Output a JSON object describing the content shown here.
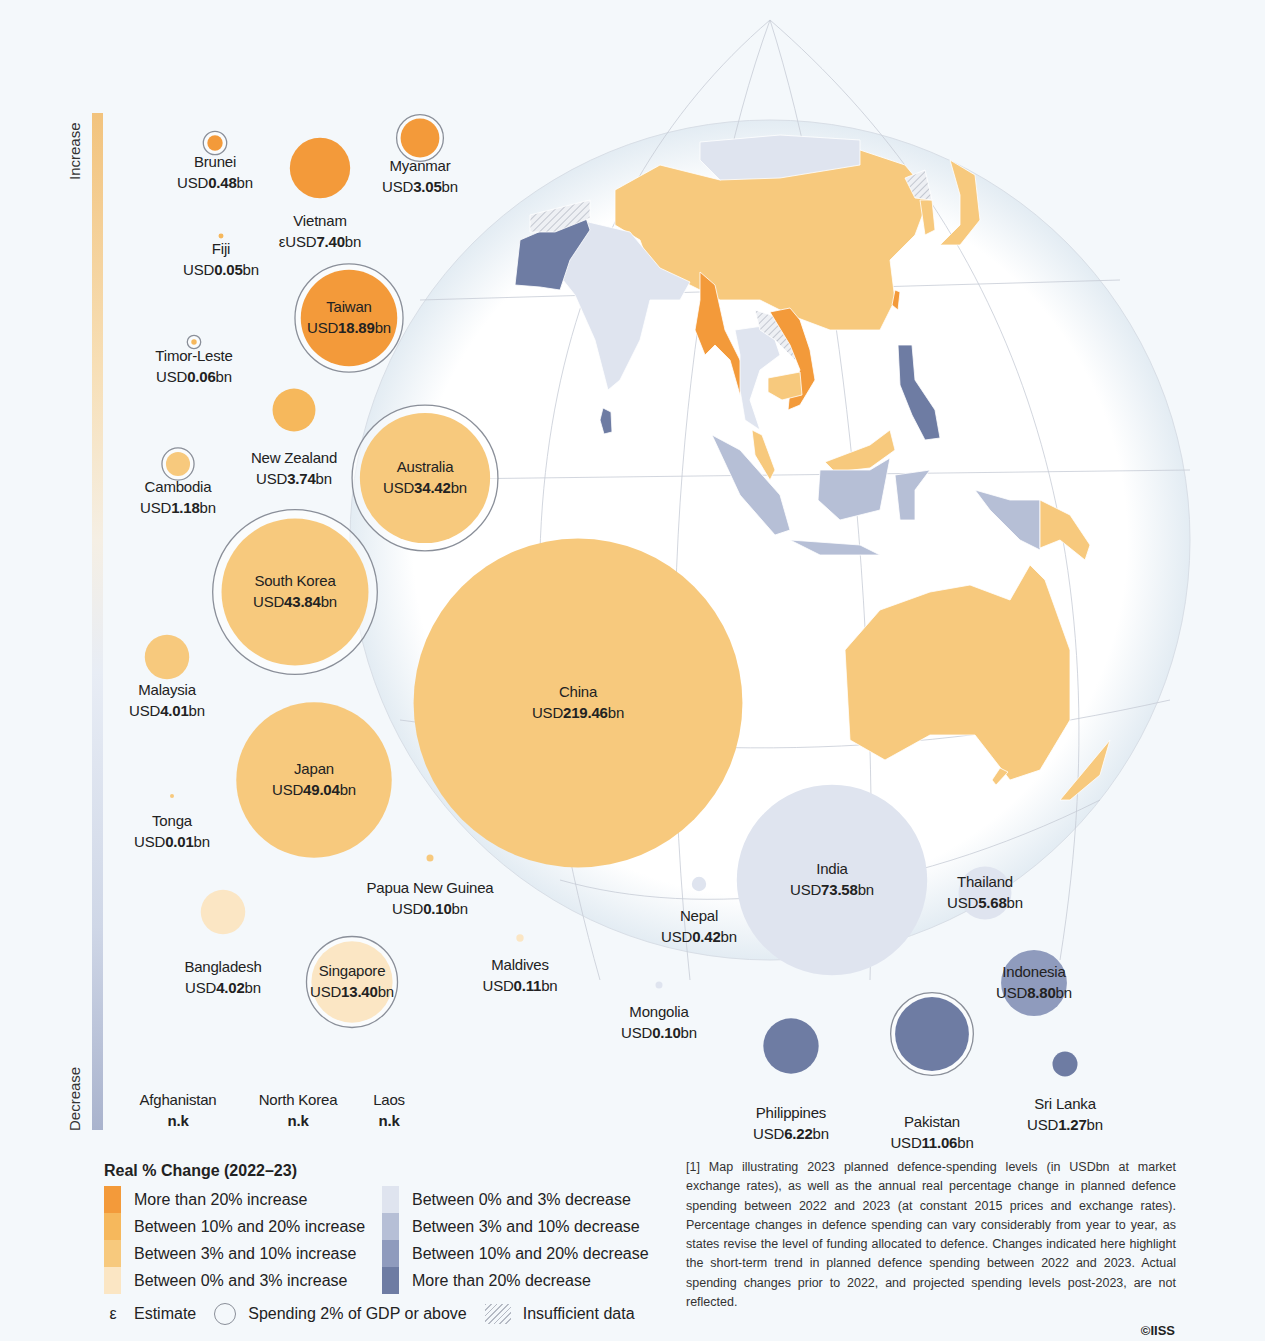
{
  "axis": {
    "top_label": "Increase",
    "bottom_label": "Decrease"
  },
  "colors": {
    "inc_gt20": "#f39a3a",
    "inc_10_20": "#f6b85c",
    "inc_3_10": "#f7c97d",
    "inc_0_3": "#fbe6c4",
    "dec_0_3": "#dfe4ef",
    "dec_3_10": "#b6bfd6",
    "dec_10_20": "#8f9bbd",
    "dec_gt20": "#6e7ca3",
    "ring": "#8a8f99",
    "background": "#f4f8fb"
  },
  "chart_data": {
    "type": "bubble-map",
    "title": "Real % Change (2022–23)",
    "unit": "USDbn",
    "countries": [
      {
        "name": "Brunei",
        "prefix": "USD",
        "value": "0.48",
        "suffix": "bn",
        "category": "inc_gt20",
        "gdp2pct": true
      },
      {
        "name": "Vietnam",
        "prefix": "εUSD",
        "value": "7.40",
        "suffix": "bn",
        "category": "inc_gt20",
        "gdp2pct": false,
        "estimate": true
      },
      {
        "name": "Myanmar",
        "prefix": "USD",
        "value": "3.05",
        "suffix": "bn",
        "category": "inc_gt20",
        "gdp2pct": true
      },
      {
        "name": "Fiji",
        "prefix": "USD",
        "value": "0.05",
        "suffix": "bn",
        "category": "inc_10_20",
        "gdp2pct": false
      },
      {
        "name": "Taiwan",
        "prefix": "USD",
        "value": "18.89",
        "suffix": "bn",
        "category": "inc_gt20",
        "gdp2pct": true
      },
      {
        "name": "Timor-Leste",
        "prefix": "USD",
        "value": "0.06",
        "suffix": "bn",
        "category": "inc_10_20",
        "gdp2pct": true
      },
      {
        "name": "New Zealand",
        "prefix": "USD",
        "value": "3.74",
        "suffix": "bn",
        "category": "inc_10_20",
        "gdp2pct": false
      },
      {
        "name": "Cambodia",
        "prefix": "USD",
        "value": "1.18",
        "suffix": "bn",
        "category": "inc_3_10",
        "gdp2pct": true
      },
      {
        "name": "Australia",
        "prefix": "USD",
        "value": "34.42",
        "suffix": "bn",
        "category": "inc_3_10",
        "gdp2pct": true
      },
      {
        "name": "South Korea",
        "prefix": "USD",
        "value": "43.84",
        "suffix": "bn",
        "category": "inc_3_10",
        "gdp2pct": true
      },
      {
        "name": "Malaysia",
        "prefix": "USD",
        "value": "4.01",
        "suffix": "bn",
        "category": "inc_3_10",
        "gdp2pct": false
      },
      {
        "name": "China",
        "prefix": "USD",
        "value": "219.46",
        "suffix": "bn",
        "category": "inc_3_10",
        "gdp2pct": false
      },
      {
        "name": "Japan",
        "prefix": "USD",
        "value": "49.04",
        "suffix": "bn",
        "category": "inc_3_10",
        "gdp2pct": false
      },
      {
        "name": "Tonga",
        "prefix": "USD",
        "value": "0.01",
        "suffix": "bn",
        "category": "inc_3_10",
        "gdp2pct": false
      },
      {
        "name": "Papua New Guinea",
        "prefix": "USD",
        "value": "0.10",
        "suffix": "bn",
        "category": "inc_3_10",
        "gdp2pct": false
      },
      {
        "name": "Bangladesh",
        "prefix": "USD",
        "value": "4.02",
        "suffix": "bn",
        "category": "inc_0_3",
        "gdp2pct": false
      },
      {
        "name": "Singapore",
        "prefix": "USD",
        "value": "13.40",
        "suffix": "bn",
        "category": "inc_0_3",
        "gdp2pct": true
      },
      {
        "name": "Maldives",
        "prefix": "USD",
        "value": "0.11",
        "suffix": "bn",
        "category": "inc_0_3",
        "gdp2pct": false
      },
      {
        "name": "Nepal",
        "prefix": "USD",
        "value": "0.42",
        "suffix": "bn",
        "category": "dec_0_3",
        "gdp2pct": false
      },
      {
        "name": "India",
        "prefix": "USD",
        "value": "73.58",
        "suffix": "bn",
        "category": "dec_0_3",
        "gdp2pct": false
      },
      {
        "name": "Thailand",
        "prefix": "USD",
        "value": "5.68",
        "suffix": "bn",
        "category": "dec_0_3",
        "gdp2pct": false
      },
      {
        "name": "Mongolia",
        "prefix": "USD",
        "value": "0.10",
        "suffix": "bn",
        "category": "dec_0_3",
        "gdp2pct": false
      },
      {
        "name": "Indonesia",
        "prefix": "USD",
        "value": "8.80",
        "suffix": "bn",
        "category": "dec_10_20",
        "gdp2pct": false
      },
      {
        "name": "Philippines",
        "prefix": "USD",
        "value": "6.22",
        "suffix": "bn",
        "category": "dec_gt20",
        "gdp2pct": false
      },
      {
        "name": "Pakistan",
        "prefix": "USD",
        "value": "11.06",
        "suffix": "bn",
        "category": "dec_gt20",
        "gdp2pct": true
      },
      {
        "name": "Sri Lanka",
        "prefix": "USD",
        "value": "1.27",
        "suffix": "bn",
        "category": "dec_gt20",
        "gdp2pct": false
      }
    ],
    "not_known": [
      {
        "name": "Afghanistan",
        "value": "n.k"
      },
      {
        "name": "North Korea",
        "value": "n.k"
      },
      {
        "name": "Laos",
        "value": "n.k"
      }
    ]
  },
  "legend": {
    "title": "Real % Change (2022–23)",
    "increase": [
      {
        "key": "inc_gt20",
        "label": "More than 20% increase"
      },
      {
        "key": "inc_10_20",
        "label": "Between 10% and 20% increase"
      },
      {
        "key": "inc_3_10",
        "label": "Between 3% and 10% increase"
      },
      {
        "key": "inc_0_3",
        "label": "Between 0% and 3% increase"
      }
    ],
    "decrease": [
      {
        "key": "dec_0_3",
        "label": "Between 0% and 3% decrease"
      },
      {
        "key": "dec_3_10",
        "label": "Between 3% and 10% decrease"
      },
      {
        "key": "dec_10_20",
        "label": "Between 10% and 20% decrease"
      },
      {
        "key": "dec_gt20",
        "label": "More than 20% decrease"
      }
    ],
    "estimate_symbol": "ε",
    "estimate_label": "Estimate",
    "gdp_label": "Spending 2% of GDP or above",
    "insufficient_label": "Insufficient data"
  },
  "note": "[1] Map illustrating 2023 planned defence-spending levels (in USDbn at market exchange rates), as well as the annual real percentage change in planned defence spending between 2022 and 2023 (at constant 2015 prices and exchange rates). Percentage changes in defence spending can vary considerably from year to year, as states revise the level of funding allocated to defence. Changes indicated here highlight the short-term trend in planned defence spending between 2022 and 2023. Actual spending changes prior to 2022, and projected spending levels post-2023, are not reflected.",
  "copyright": "©IISS"
}
